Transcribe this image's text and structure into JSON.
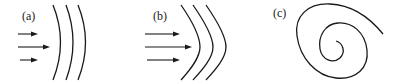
{
  "figure": {
    "panels": [
      {
        "id": "a",
        "label": "(a)",
        "description": "Plane-ish wavefronts, slightly curved, with three incoming arrows"
      },
      {
        "id": "b",
        "label": "(b)",
        "description": "Chevron-shaped (V) wavefronts with three incoming arrows"
      },
      {
        "id": "c",
        "label": "(c)",
        "description": "Spiral curve"
      }
    ]
  },
  "colors": {
    "line": "#1a1a1a",
    "background": "#ffffff"
  }
}
